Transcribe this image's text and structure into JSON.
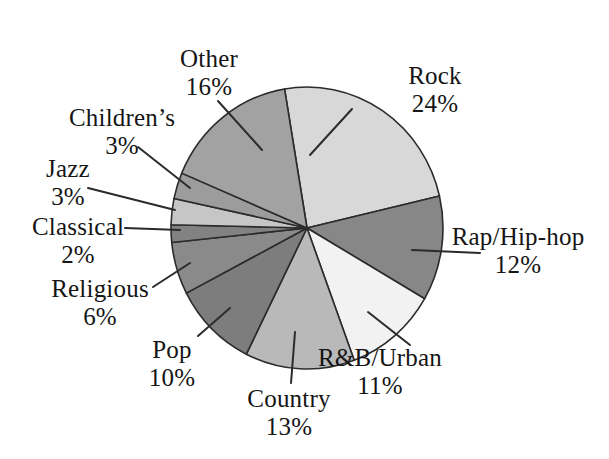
{
  "chart_data": {
    "type": "pie",
    "title": "",
    "subtitle": "",
    "unit": "%",
    "legend": "none (direct labels with leader lines)",
    "background_color": "#ffffff",
    "text_color": "#151515",
    "outline_color": "#2b2b2b",
    "geometry": {
      "cx": 307,
      "cy": 228,
      "rx": 136,
      "ry": 141,
      "start_angle_deg": -9.5,
      "direction": "clockwise"
    },
    "categories": [
      "Rock",
      "Rap/Hip-hop",
      "R&B/Urban",
      "Country",
      "Pop",
      "Religious",
      "Classical",
      "Jazz",
      "Children’s",
      "Other"
    ],
    "values": [
      24,
      12,
      11,
      13,
      10,
      6,
      2,
      3,
      3,
      16
    ],
    "slices": [
      {
        "label": "Rock",
        "value": 24,
        "pct_text": "24%",
        "color": "#d8d8d8",
        "label_x": 435,
        "label_y": 90,
        "leader": [
          352,
          109,
          310,
          155
        ]
      },
      {
        "label": "Rap/Hip-hop",
        "value": 12,
        "pct_text": "12%",
        "color": "#878787",
        "label_x": 518,
        "label_y": 251,
        "leader": [
          480,
          253,
          412,
          250
        ]
      },
      {
        "label": "R&B/Urban",
        "value": 11,
        "pct_text": "11%",
        "color": "#f2f2f2",
        "label_x": 380,
        "label_y": 372,
        "leader": [
          410,
          345,
          368,
          312
        ]
      },
      {
        "label": "Country",
        "value": 13,
        "pct_text": "13%",
        "color": "#b9b9b9",
        "label_x": 289,
        "label_y": 413,
        "leader": [
          291,
          383,
          295,
          332
        ]
      },
      {
        "label": "Pop",
        "value": 10,
        "pct_text": "10%",
        "color": "#7d7d7d",
        "label_x": 172,
        "label_y": 364,
        "leader": [
          198,
          336,
          230,
          308
        ]
      },
      {
        "label": "Religious",
        "value": 6,
        "pct_text": "6%",
        "color": "#8a8a8a",
        "label_x": 100,
        "label_y": 303,
        "leader": [
          153,
          287,
          190,
          263
        ]
      },
      {
        "label": "Classical",
        "value": 2,
        "pct_text": "2%",
        "color": "#828282",
        "label_x": 78,
        "label_y": 241,
        "leader": [
          125,
          228,
          180,
          230
        ]
      },
      {
        "label": "Jazz",
        "value": 3,
        "pct_text": "3%",
        "color": "#c6c6c6",
        "label_x": 68,
        "label_y": 183,
        "leader": [
          88,
          188,
          175,
          210
        ]
      },
      {
        "label": "Children’s",
        "value": 3,
        "pct_text": "3%",
        "color": "#9c9c9c",
        "label_x": 122,
        "label_y": 132,
        "leader": [
          138,
          147,
          190,
          188
        ]
      },
      {
        "label": "Other",
        "value": 16,
        "pct_text": "16%",
        "color": "#a2a2a2",
        "label_x": 209,
        "label_y": 73,
        "leader": [
          218,
          101,
          262,
          150
        ]
      }
    ]
  }
}
